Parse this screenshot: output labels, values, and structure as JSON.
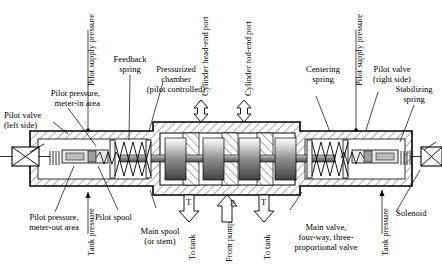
{
  "figure": {
    "type": "hydraulic-valve-cross-section",
    "line_color": "#000000",
    "hatch_color": "#555555",
    "spool_land_color": "#9a9a9a"
  },
  "labels": {
    "pilot_supply_pressure_left": "Pilot supply pressure",
    "pilot_supply_pressure_right": "Pilot supply pressure",
    "feedback_spring": "Feedback\nspring",
    "pressurized_chamber": "Pressurized\nchamber\n(pilot controlled)",
    "cylinder_head_end_port": "Cylinder head-end port",
    "cylinder_rod_end_port": "Cylinder rod-end port",
    "centering_spring": "Centering\nspring",
    "pilot_valve_left": "Pilot valve\n(left side)",
    "pilot_valve_right": "Pilot valve\n(right side)",
    "stabilizing_spring": "Stabilizing\nspring",
    "pilot_pressure_meter_in": "Pilot pressure,\nmeter-in area",
    "pilot_pressure_meter_out": "Pilot pressure,\nmeter-out area",
    "tank_pressure_left": "Tank pressure",
    "tank_pressure_right": "Tank pressure",
    "pilot_spool": "Pilot spool",
    "main_spool": "Main spool\n(or stem)",
    "main_valve": "Main valve,\nfour-way, three-\nproportional valve",
    "solenoid": "Solenoid"
  },
  "ports": [
    {
      "id": "tank-left",
      "symbol": "T",
      "caption": "To tank",
      "direction": "down"
    },
    {
      "id": "pump",
      "symbol": "P",
      "caption": "From pump",
      "direction": "up"
    },
    {
      "id": "tank-right",
      "symbol": "T",
      "caption": "To tank",
      "direction": "down"
    },
    {
      "id": "cyl-head-end",
      "symbol": "",
      "caption": "Cylinder head-end port",
      "direction": "bidirectional"
    },
    {
      "id": "cyl-rod-end",
      "symbol": "",
      "caption": "Cylinder rod-end port",
      "direction": "bidirectional"
    }
  ],
  "components": [
    {
      "name": "solenoid-left",
      "kind": "solenoid"
    },
    {
      "name": "solenoid-right",
      "kind": "solenoid"
    },
    {
      "name": "pilot-spool-left",
      "kind": "spool"
    },
    {
      "name": "pilot-spool-right",
      "kind": "spool"
    },
    {
      "name": "feedback-spring",
      "kind": "coil-spring"
    },
    {
      "name": "centering-spring",
      "kind": "coil-spring"
    },
    {
      "name": "stabilizing-spring-left",
      "kind": "coil-spring"
    },
    {
      "name": "stabilizing-spring-right",
      "kind": "coil-spring"
    },
    {
      "name": "main-spool",
      "kind": "spool",
      "lands": 4
    }
  ]
}
